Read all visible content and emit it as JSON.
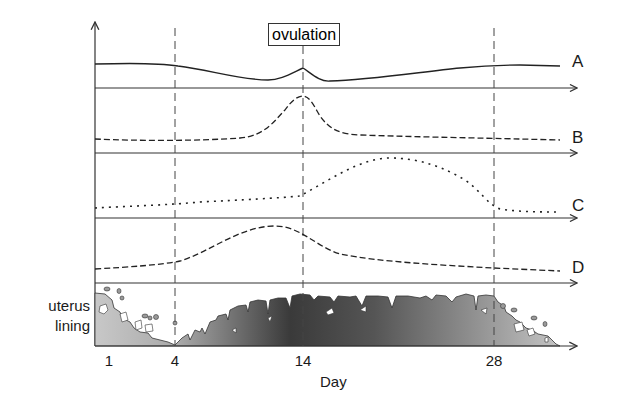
{
  "diagram": {
    "annotation": "ovulation",
    "curve_labels": [
      "A",
      "B",
      "C",
      "D"
    ],
    "lining_label_line1": "uterus",
    "lining_label_line2": "lining",
    "x_axis_title": "Day",
    "x_ticks": [
      "1",
      "4",
      "14",
      "28"
    ],
    "colors": {
      "line": "#333333",
      "lining_light": "#c4c4c4",
      "lining_dark": "#3c3c3c",
      "background": "#ffffff"
    },
    "curves": [
      {
        "name": "A",
        "style": "solid",
        "description": "level, dips before ovulation, small peak at day 14, then gradually rises"
      },
      {
        "name": "B",
        "style": "dashed",
        "description": "low, sharp peak at day 14, then low"
      },
      {
        "name": "C",
        "style": "dotted",
        "description": "low, rises after day 14, broad peak around day 21, falls by day 28"
      },
      {
        "name": "D",
        "style": "dashed",
        "description": "low, broad peak around day 12, declines after ovulation"
      }
    ],
    "markers": [
      {
        "day": "4",
        "style": "dashed-vertical"
      },
      {
        "day": "14",
        "style": "dashed-vertical"
      },
      {
        "day": "28",
        "style": "dashed-vertical"
      }
    ]
  }
}
